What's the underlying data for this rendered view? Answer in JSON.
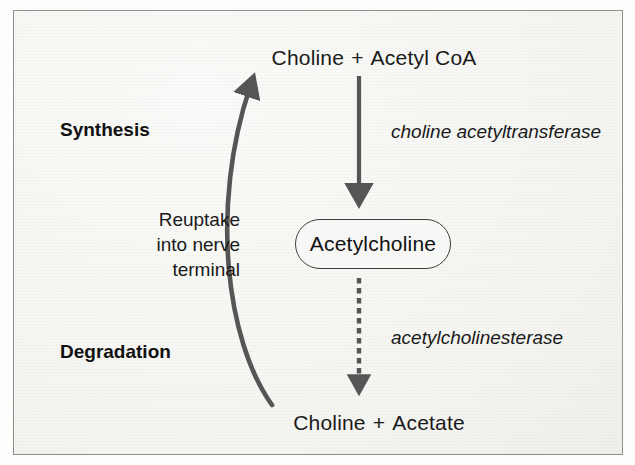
{
  "figure": {
    "kind": "biochemical-pathway-diagram",
    "background_color": "#f7f7f5",
    "border_color": "#8e8e8e",
    "arrow_color": "#555555",
    "text_color": "#1a1a1a"
  },
  "sections": {
    "synthesis_label": "Synthesis",
    "degradation_label": "Degradation"
  },
  "nodes": {
    "top_reactants": {
      "left": "Choline",
      "operator": "+",
      "right": "Acetyl CoA"
    },
    "center": {
      "label": "Acetylcholine"
    },
    "bottom_products": {
      "left": "Choline",
      "operator": "+",
      "right": "Acetate"
    }
  },
  "enzymes": {
    "synthesis": "choline acetyltransferase",
    "degradation": "acetylcholinesterase"
  },
  "annotations": {
    "reuptake": {
      "line1": "Reuptake",
      "line2": "into nerve",
      "line3": "terminal"
    }
  },
  "arrows": {
    "synthesis_arrow": {
      "style": "solid",
      "direction": "down",
      "from": "Choline + Acetyl CoA",
      "to": "Acetylcholine"
    },
    "degradation_arrow": {
      "style": "dashed",
      "direction": "down",
      "from": "Acetylcholine",
      "to": "Choline + Acetate"
    },
    "reuptake_arrow": {
      "style": "curved-solid",
      "direction": "up",
      "from": "Choline + Acetate",
      "to": "Choline + Acetyl CoA"
    }
  }
}
